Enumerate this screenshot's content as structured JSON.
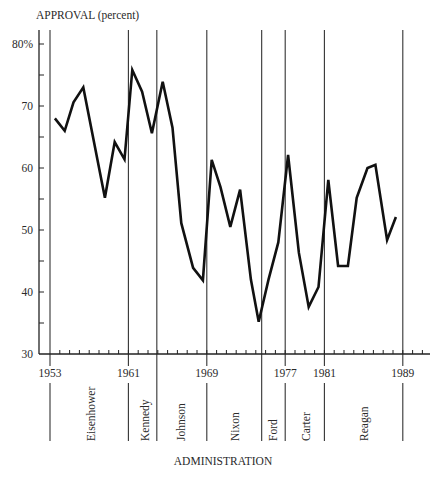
{
  "chart_data": {
    "type": "line",
    "title": "",
    "ylabel": "APPROVAL (percent)",
    "xlabel": "ADMINISTRATION",
    "ylim": [
      30,
      82
    ],
    "xlim": [
      1952,
      1991.8
    ],
    "y_ticks": [
      30,
      40,
      50,
      60,
      70,
      80
    ],
    "y_tick_labels": [
      "30",
      "40",
      "50",
      "60",
      "70",
      "80%"
    ],
    "y_minor_ticks": [
      35,
      45,
      55,
      65,
      75
    ],
    "x_tick_labels": [
      "1953",
      "1961",
      "1969",
      "1977",
      "1981",
      "1989"
    ],
    "x_tick_years": [
      1953,
      1961,
      1969,
      1977,
      1981,
      1989
    ],
    "x_minor_ticks": "yearly",
    "grid": false,
    "legend": null,
    "administration_boundaries": [
      1953,
      1961,
      1963.9,
      1969,
      1974.6,
      1977,
      1981,
      1989
    ],
    "administrations": [
      {
        "name": "Eisenhower",
        "start": 1953,
        "end": 1961
      },
      {
        "name": "Kennedy",
        "start": 1961,
        "end": 1963.9
      },
      {
        "name": "Johnson",
        "start": 1963.9,
        "end": 1969
      },
      {
        "name": "Nixon",
        "start": 1969,
        "end": 1974.6
      },
      {
        "name": "Ford",
        "start": 1974.6,
        "end": 1977
      },
      {
        "name": "Carter",
        "start": 1977,
        "end": 1981
      },
      {
        "name": "Reagan",
        "start": 1981,
        "end": 1989
      }
    ],
    "series": [
      {
        "name": "Presidential approval",
        "x": [
          1953.5,
          1954.5,
          1955.4,
          1956.4,
          1958.6,
          1959.6,
          1960.6,
          1961.4,
          1962.4,
          1963.4,
          1964.5,
          1965.5,
          1966.4,
          1967.6,
          1968.6,
          1969.5,
          1970.4,
          1971.4,
          1972.4,
          1973.5,
          1974.3,
          1975.3,
          1976.3,
          1977.3,
          1978.4,
          1979.4,
          1980.4,
          1981.4,
          1982.4,
          1983.4,
          1984.3,
          1985.4,
          1986.2,
          1987.4,
          1988.3
        ],
        "values": [
          68,
          66,
          70.6,
          73,
          55.2,
          64.2,
          61.4,
          75.8,
          72.3,
          65.6,
          73.9,
          66.5,
          51.1,
          43.9,
          41.9,
          61.3,
          56.9,
          50.5,
          56.5,
          42,
          35.2,
          42,
          48,
          62.1,
          46.3,
          37.6,
          40.8,
          58.1,
          44.2,
          44.2,
          55.2,
          60,
          60.5,
          48.4,
          52.1
        ]
      }
    ]
  }
}
